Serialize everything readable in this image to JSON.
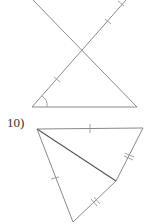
{
  "figures": [
    {
      "id": "figure-9-partial",
      "description": "Two triangles sharing a vertex (vertical angles), partially cropped at top",
      "markings": [
        "single tick on upper-right segment",
        "single tick on lower-left segment",
        "angle arc at bottom-left vertex"
      ]
    },
    {
      "id": "figure-10",
      "label": "10)",
      "description": "Quadrilateral divided by a diagonal into two triangles",
      "markings": [
        "single tick on top side",
        "double tick on upper-right side",
        "single tick on left side",
        "double tick on lower-right side"
      ]
    }
  ],
  "colors": {
    "line": "#8a8a8a",
    "dark_line": "#555555",
    "text": "#333333",
    "background": "#ffffff"
  }
}
